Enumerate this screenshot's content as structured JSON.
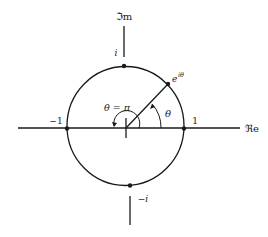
{
  "diagram": {
    "type": "unit-circle-complex-plane",
    "axes": {
      "real_label": "ℜe",
      "imag_label": "ℑm"
    },
    "points": {
      "one": "1",
      "minus_one": "−1",
      "i": "i",
      "minus_i": "−i",
      "e_i_theta_base": "e",
      "e_i_theta_exp": "iθ"
    },
    "angles": {
      "theta": "θ",
      "theta_pi": "θ = π"
    },
    "colors": {
      "stroke": "#1a1a1a",
      "background": "#ffffff"
    }
  }
}
